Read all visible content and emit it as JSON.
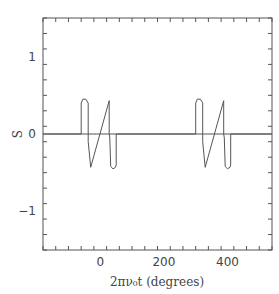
{
  "chart_data": {
    "type": "line",
    "title": "",
    "xlabel": "2πν₀t (degrees)",
    "ylabel": "S",
    "xlim": [
      -180,
      540
    ],
    "ylim": [
      -1.5,
      1.5
    ],
    "x_ticks": [
      0,
      200,
      400
    ],
    "x_tick_labels": [
      "0",
      "200",
      "400"
    ],
    "y_ticks": [
      -1,
      0,
      1
    ],
    "y_tick_labels": [
      "−1",
      "0",
      "1"
    ],
    "grid": false,
    "legend": null,
    "series": [
      {
        "name": "S",
        "x": [
          -180,
          -60,
          -60,
          -55,
          -45,
          -38,
          -38,
          -30,
          28,
          28,
          30,
          33,
          40,
          48,
          50,
          50,
          300,
          300,
          305,
          315,
          322,
          322,
          330,
          388,
          388,
          390,
          393,
          400,
          408,
          410,
          410,
          540
        ],
        "y": [
          0,
          0,
          0.4,
          0.45,
          0.45,
          0.4,
          -0.1,
          -0.43,
          0.43,
          0,
          -0.05,
          -0.42,
          -0.45,
          -0.43,
          -0.4,
          0,
          0,
          0.4,
          0.45,
          0.45,
          0.4,
          -0.1,
          -0.43,
          0.43,
          0,
          -0.05,
          -0.42,
          -0.45,
          -0.43,
          -0.4,
          0,
          0
        ]
      }
    ]
  }
}
